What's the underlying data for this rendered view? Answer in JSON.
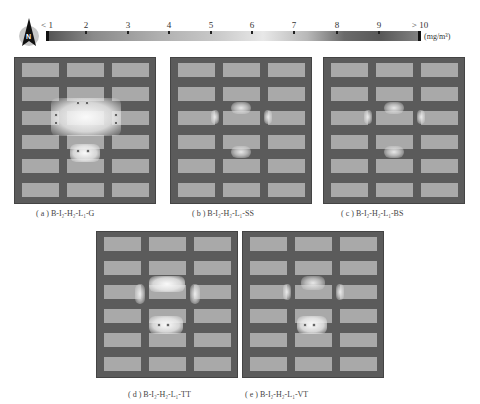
{
  "north_arrow": {
    "icon": "north-arrow-icon",
    "label": "N"
  },
  "scale_bar": {
    "unit": "(mg/m³)",
    "ticks": [
      "< 1",
      "2",
      "3",
      "4",
      "5",
      "6",
      "7",
      "8",
      "9",
      "> 10"
    ]
  },
  "panels": [
    {
      "id": "a",
      "caption_prefix": "( a )",
      "caption": "B-I₂-H₂-L₁-G"
    },
    {
      "id": "b",
      "caption_prefix": "( b )",
      "caption": "B-I₂-H₂-L₁-SS"
    },
    {
      "id": "c",
      "caption_prefix": "( c )",
      "caption": "B-I₂-H₂-L₁-BS"
    },
    {
      "id": "d",
      "caption_prefix": "( d )",
      "caption": "B-I₂-H₂-L₁-TT"
    },
    {
      "id": "e",
      "caption_prefix": "( e )",
      "caption": "B-I₂-H₂-L₁-VT"
    }
  ],
  "layout": {
    "rows": 6,
    "cols": 3
  },
  "colors": {
    "street": "#5b5b5b",
    "building": "#a9a9a9",
    "high_concentration": "#f0f0f0"
  }
}
